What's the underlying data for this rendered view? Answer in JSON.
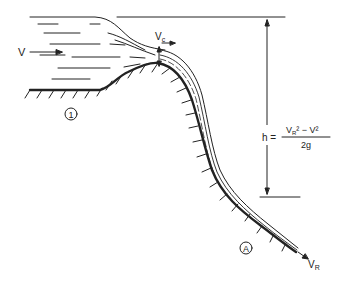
{
  "diagram": {
    "labels": {
      "upstream_velocity": "V",
      "critical_velocity": "V",
      "critical_sub": "c",
      "final_velocity": "V",
      "final_sub": "R",
      "region_1": "1",
      "region_a": "A",
      "formula_lhs": "h =",
      "formula_num_v": "V",
      "formula_num_sub": "R",
      "formula_num_rest": "² − V²",
      "formula_den": "2g"
    },
    "colors": {
      "ink": "#222222",
      "background": "#ffffff"
    }
  }
}
